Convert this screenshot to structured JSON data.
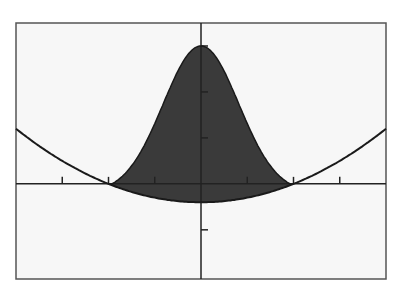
{
  "chart_data": {
    "type": "area",
    "title": "",
    "xlabel": "",
    "ylabel": "",
    "xlim": [
      -4,
      4
    ],
    "ylim": [
      -2.07,
      3.5
    ],
    "grid": false,
    "legend": null,
    "x_ticks": [
      -3,
      -2,
      -1,
      1,
      2,
      3
    ],
    "y_ticks": [
      -1,
      1,
      2,
      3
    ],
    "series": [
      {
        "name": "upper bell curve",
        "description": "bell-shaped curve peaking at (0, 3), meeting lower curve at x = ±2",
        "x": [
          -2,
          -1.5,
          -1,
          -0.5,
          0,
          0.5,
          1,
          1.5,
          2
        ],
        "values": [
          0.0,
          0.72,
          1.46,
          2.5,
          3.0,
          2.5,
          1.46,
          0.72,
          0.0
        ]
      },
      {
        "name": "lower parabola",
        "description": "upward parabola with vertex near (0, -0.4), crossing x-axis at x = ±2",
        "x": [
          -4,
          -3,
          -2,
          -1,
          0,
          1,
          2,
          3,
          4
        ],
        "values": [
          1.2,
          0.5,
          0.0,
          -0.3,
          -0.4,
          -0.3,
          0.0,
          0.5,
          1.2
        ]
      }
    ],
    "shaded_region": {
      "between": [
        "upper bell curve",
        "lower parabola"
      ],
      "x_range": [
        -2,
        2
      ],
      "color": "#3a3a3a"
    }
  },
  "style": {
    "background": "#f7f7f7",
    "frame": "#555555",
    "curve": "#1a1a1a",
    "fill": "#3a3a3a"
  }
}
